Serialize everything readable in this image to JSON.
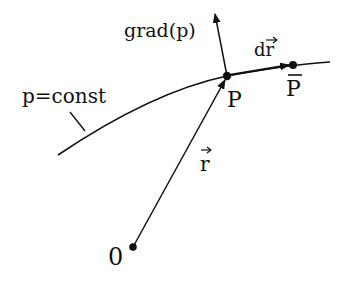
{
  "diagram": {
    "labels": {
      "grad": "grad(p)",
      "dr": "dr",
      "p_const": "p=const",
      "P": "P",
      "P_bar": "P",
      "r": "r",
      "origin": "0"
    },
    "colors": {
      "ink": "#111111",
      "background": "#ffffff"
    }
  }
}
